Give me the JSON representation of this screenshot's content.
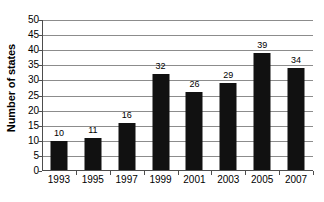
{
  "chart_data": {
    "type": "bar",
    "title": "",
    "xlabel": "",
    "ylabel": "Number of states",
    "categories": [
      "1993",
      "1995",
      "1997",
      "1999",
      "2001",
      "2003",
      "2005",
      "2007"
    ],
    "values": [
      10,
      11,
      16,
      32,
      26,
      29,
      39,
      34
    ],
    "series": [
      {
        "name": "Number of states",
        "values": [
          10,
          11,
          16,
          32,
          26,
          29,
          39,
          34
        ]
      }
    ],
    "value_labels": [
      "10",
      "11",
      "16",
      "32",
      "26",
      "29",
      "39",
      "34"
    ],
    "ylim": [
      0,
      50
    ],
    "ytick_step": 5,
    "yticks": [
      0,
      5,
      10,
      15,
      20,
      25,
      30,
      35,
      40,
      45,
      50
    ],
    "ytick_labels": [
      "0",
      "5",
      "10",
      "15",
      "20",
      "25",
      "30",
      "35",
      "40",
      "45",
      "50"
    ],
    "grid": "horizontal",
    "legend": "none",
    "bar_color": "#111111",
    "gridline_color": "#8c8c8c",
    "axis_color": "#4d4d4d",
    "background_color": "#ffffff"
  }
}
